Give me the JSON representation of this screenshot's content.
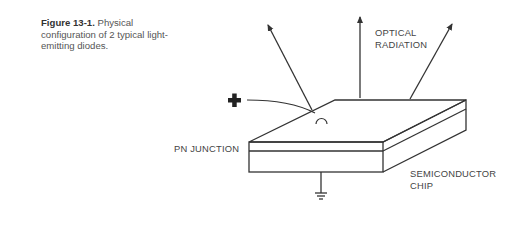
{
  "caption": {
    "figure_label": "Figure 13-1.",
    "text": " Physical configuration of 2 typical light-emitting diodes."
  },
  "labels": {
    "optical_line1": "OPTICAL",
    "optical_line2": "RADIATION",
    "pn_junction": "PN JUNCTION",
    "chip_line1": "SEMICONDUCTOR",
    "chip_line2": "CHIP"
  },
  "symbols": {
    "terminal": "plus-terminal",
    "ground": "ground-symbol"
  },
  "colors": {
    "stroke": "#333333",
    "text": "#444444",
    "background": "#ffffff"
  }
}
